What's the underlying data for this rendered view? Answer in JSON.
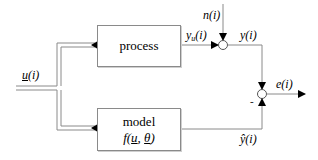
{
  "diagram": {
    "type": "block-diagram",
    "blocks": {
      "process": {
        "label": "process"
      },
      "model": {
        "label": "model",
        "function_prefix": "f(",
        "arg1": "u",
        "sep": ", ",
        "arg2": "θ",
        "function_suffix": ")"
      }
    },
    "signals": {
      "input": {
        "name": "u",
        "arg": "(i)"
      },
      "process_output": {
        "name": "y",
        "sub": "u",
        "arg": "(i)"
      },
      "noise": {
        "name": "n",
        "arg": "(i)"
      },
      "measured_output": {
        "name": "y",
        "arg": "(i)"
      },
      "error": {
        "name": "e",
        "arg": "(i)"
      },
      "model_output": {
        "name": "ŷ",
        "arg": "(i)"
      }
    },
    "junction_signs": {
      "error_minus": "-"
    },
    "colors": {
      "line": "#8a8a8a",
      "arrow": "#000000",
      "background": "#ffffff"
    }
  }
}
